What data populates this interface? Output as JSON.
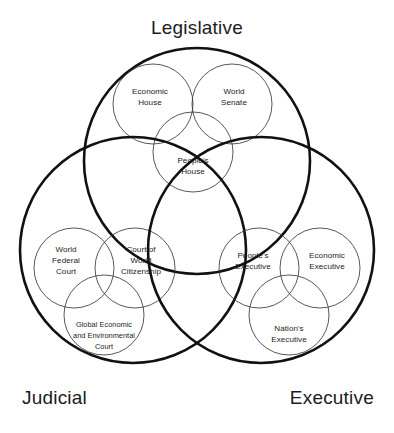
{
  "diagram": {
    "title_hidden": "",
    "background_color": "#ffffff",
    "big_circle_color": "#111111",
    "small_circle_color": "#3a3a3a",
    "text_color": "#1c1c1c",
    "branches": [
      {
        "id": "legislative",
        "label": "Legislative",
        "nodes": [
          {
            "id": "economic-house",
            "lines": [
              "Economic",
              "House"
            ]
          },
          {
            "id": "world-senate",
            "lines": [
              "World",
              "Senate"
            ]
          },
          {
            "id": "peoples-house",
            "lines": [
              "People's",
              "House"
            ]
          }
        ]
      },
      {
        "id": "judicial",
        "label": "Judicial",
        "nodes": [
          {
            "id": "world-federal-court",
            "lines": [
              "World",
              "Federal",
              "Court"
            ]
          },
          {
            "id": "court-of-world-citizenship",
            "lines": [
              "Court of",
              "World",
              "Citizenship"
            ]
          },
          {
            "id": "global-economic-and-environmental-court",
            "lines": [
              "Global Economic",
              "and Environmental",
              "Court"
            ]
          }
        ]
      },
      {
        "id": "executive",
        "label": "Executive",
        "nodes": [
          {
            "id": "peoples-executive",
            "lines": [
              "People's",
              "Executive"
            ]
          },
          {
            "id": "economic-executive",
            "lines": [
              "Economic",
              "Executive"
            ]
          },
          {
            "id": "nations-executive",
            "lines": [
              "Nation's",
              "Executive"
            ]
          }
        ]
      }
    ]
  }
}
